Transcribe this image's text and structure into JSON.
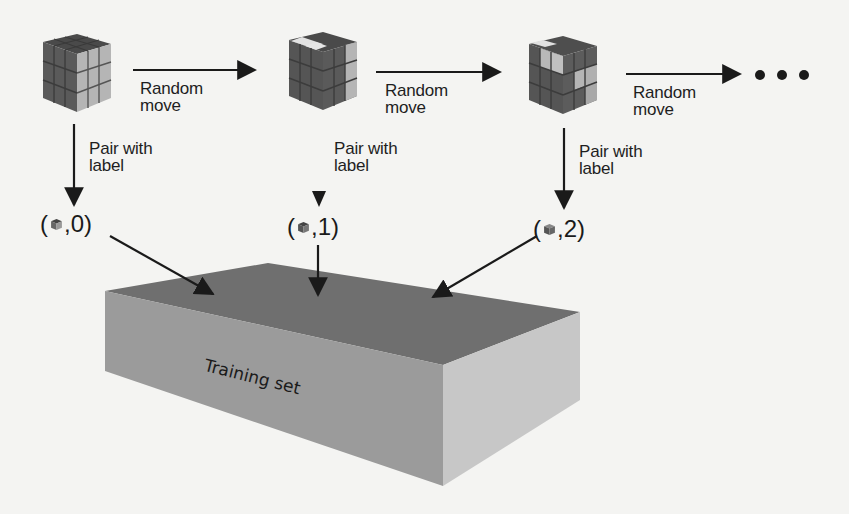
{
  "diagram": {
    "type": "training-data-generation-flow",
    "states": [
      {
        "id": "cube-0",
        "description": "solved cube",
        "label_value": "0"
      },
      {
        "id": "cube-1",
        "description": "cube after 1 random move",
        "label_value": "1"
      },
      {
        "id": "cube-2",
        "description": "cube after 2 random moves",
        "label_value": "2"
      }
    ],
    "transitions": [
      {
        "from": "cube-0",
        "to": "cube-1",
        "line1": "Random",
        "line2": "move"
      },
      {
        "from": "cube-1",
        "to": "cube-2",
        "line1": "Random",
        "line2": "move"
      },
      {
        "from": "cube-2",
        "to": "continuation",
        "line1": "Random",
        "line2": "move"
      }
    ],
    "pair_labels": [
      {
        "line1": "Pair with",
        "line2": "label"
      },
      {
        "line1": "Pair with",
        "line2": "label"
      },
      {
        "line1": "Pair with",
        "line2": "label"
      }
    ],
    "tuples": [
      {
        "open": "(",
        "sep": ",",
        "value": "0",
        "close": ")"
      },
      {
        "open": "(",
        "sep": ",",
        "value": "1",
        "close": ")"
      },
      {
        "open": "(",
        "sep": ",",
        "value": "2",
        "close": ")"
      }
    ],
    "continuation": "• • •",
    "dataset": {
      "label": "Training set"
    }
  },
  "colors": {
    "background": "#f4f4f2",
    "ink": "#1a1a1a",
    "cube_dark": "#5c5c5c",
    "cube_top": "#4a4a4a",
    "cube_light": "#b8b8b8",
    "cube_highlight": "#e6e6e6",
    "box_top": "#6e6e6e",
    "box_front": "#9a9a9a",
    "box_side": "#c6c6c6"
  }
}
